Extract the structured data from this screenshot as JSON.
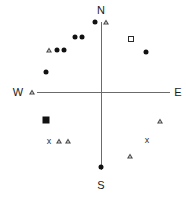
{
  "chart_data": {
    "type": "scatter",
    "title": "",
    "xlabel": "",
    "ylabel": "",
    "xlim": [
      -100,
      100
    ],
    "ylim": [
      -100,
      100
    ],
    "grid": false,
    "legend": null,
    "orientation": "compass",
    "axis_labels": {
      "north": "N",
      "east": "E",
      "south": "S",
      "west": "W"
    },
    "axes": {
      "origin": {
        "x": 101,
        "y": 92
      },
      "horizontal": {
        "x1": 37,
        "x2": 170,
        "y": 92
      },
      "vertical": {
        "y1": 22,
        "y2": 170,
        "x": 101
      },
      "color": "#6b6b6b"
    },
    "marker_types": {
      "filled-circle": "filled circle",
      "open-triangle": "open triangle",
      "open-square": "open square",
      "filled-square": "filled square",
      "cross": "x"
    },
    "series": [
      {
        "name": "filled-circle",
        "marker": "filled-circle",
        "points": [
          {
            "x": 95,
            "y": 22
          },
          {
            "x": 75,
            "y": 37
          },
          {
            "x": 82,
            "y": 37
          },
          {
            "x": 57,
            "y": 50
          },
          {
            "x": 64,
            "y": 50
          },
          {
            "x": 46,
            "y": 72
          },
          {
            "x": 146,
            "y": 52
          },
          {
            "x": 101,
            "y": 167
          }
        ]
      },
      {
        "name": "open-triangle",
        "marker": "open-triangle",
        "points": [
          {
            "x": 106,
            "y": 22
          },
          {
            "x": 49,
            "y": 50
          },
          {
            "x": 32,
            "y": 92
          },
          {
            "x": 59,
            "y": 141
          },
          {
            "x": 68,
            "y": 141
          },
          {
            "x": 160,
            "y": 121
          },
          {
            "x": 130,
            "y": 156
          }
        ]
      },
      {
        "name": "open-square",
        "marker": "open-square",
        "points": [
          {
            "x": 131,
            "y": 39
          }
        ]
      },
      {
        "name": "filled-square",
        "marker": "filled-square",
        "points": [
          {
            "x": 46,
            "y": 120
          }
        ]
      },
      {
        "name": "cross",
        "marker": "cross",
        "label": "x",
        "points": [
          {
            "x": 49,
            "y": 141
          },
          {
            "x": 147,
            "y": 140
          }
        ]
      }
    ],
    "compass_label_positions": {
      "north": {
        "x": 101,
        "y": 10
      },
      "east": {
        "x": 178,
        "y": 92
      },
      "south": {
        "x": 101,
        "y": 185
      },
      "west": {
        "x": 18,
        "y": 92
      }
    }
  }
}
